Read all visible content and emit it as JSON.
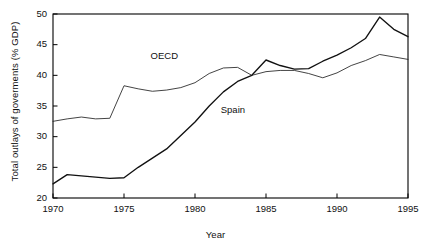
{
  "chart_data": {
    "type": "line",
    "title": "",
    "xlabel": "Year",
    "ylabel": "Total outlays of goverments (% GDP)",
    "xlim": [
      1970,
      1995
    ],
    "ylim": [
      20,
      50
    ],
    "xticks": [
      1970,
      1975,
      1980,
      1985,
      1990,
      1995
    ],
    "yticks": [
      20,
      25,
      30,
      35,
      40,
      45,
      50
    ],
    "grid": false,
    "legend": "inline-annotations",
    "x": [
      1970,
      1971,
      1972,
      1973,
      1974,
      1975,
      1976,
      1977,
      1978,
      1979,
      1980,
      1981,
      1982,
      1983,
      1984,
      1985,
      1986,
      1987,
      1988,
      1989,
      1990,
      1991,
      1992,
      1993,
      1994,
      1995
    ],
    "series": [
      {
        "name": "OECD",
        "color": "#222222",
        "style": "thin",
        "label_x": 1978.0,
        "label_y": 43.1,
        "values": [
          32.5,
          32.9,
          33.2,
          32.9,
          33.0,
          38.3,
          37.8,
          37.4,
          37.6,
          38.0,
          38.8,
          40.3,
          41.2,
          41.3,
          40.0,
          40.6,
          40.8,
          40.8,
          40.3,
          39.6,
          40.4,
          41.6,
          42.4,
          43.4,
          43.0,
          42.6
        ]
      },
      {
        "name": "Spain",
        "color": "#111111",
        "style": "thick",
        "label_x": 1982.8,
        "label_y": 34.4,
        "values": [
          22.3,
          23.8,
          23.6,
          23.4,
          23.2,
          23.3,
          25.0,
          26.5,
          28.0,
          30.2,
          32.4,
          35.0,
          37.3,
          39.0,
          40.0,
          42.5,
          41.6,
          41.0,
          41.1,
          42.3,
          43.3,
          44.5,
          46.0,
          49.5,
          47.5,
          46.3
        ]
      }
    ]
  },
  "axis_titles": {
    "y": "Total outlays of goverments (% GDP)",
    "x": "Year"
  },
  "tick_labels": {
    "y": [
      "50",
      "45",
      "40",
      "35",
      "30",
      "25",
      "20"
    ],
    "x": [
      "1970",
      "1975",
      "1980",
      "1985",
      "1990",
      "1995"
    ]
  },
  "annotations": {
    "oecd": "OECD",
    "spain": "Spain"
  }
}
